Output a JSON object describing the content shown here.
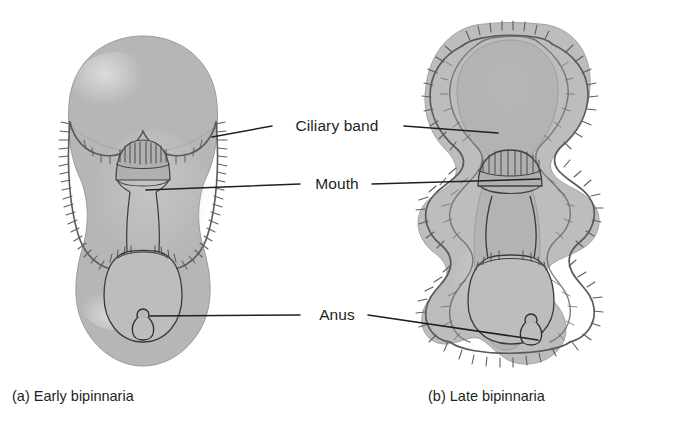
{
  "figure": {
    "type": "biological-diagram",
    "background_color": "#ffffff",
    "ink_color": "#231f20"
  },
  "labels": [
    {
      "id": "ciliary-band",
      "text": "Ciliary band",
      "x": 337,
      "y": 126
    },
    {
      "id": "mouth",
      "text": "Mouth",
      "x": 337,
      "y": 184
    },
    {
      "id": "anus",
      "text": "Anus",
      "x": 337,
      "y": 315
    }
  ],
  "captions": [
    {
      "id": "caption-a",
      "text": "(a) Early bipinnaria",
      "x": 12,
      "y": 388
    },
    {
      "id": "caption-b",
      "text": "(b) Late bipinnaria",
      "x": 428,
      "y": 388
    }
  ],
  "leaders": [
    {
      "id": "ciliary-band-left",
      "from": [
        272,
        126
      ],
      "to": [
        212,
        137
      ]
    },
    {
      "id": "ciliary-band-right",
      "from": [
        404,
        126
      ],
      "to": [
        498,
        133
      ]
    },
    {
      "id": "mouth-left",
      "from": [
        300,
        184
      ],
      "to": [
        146,
        190
      ]
    },
    {
      "id": "mouth-right",
      "from": [
        372,
        184
      ],
      "to": [
        540,
        179
      ]
    },
    {
      "id": "anus-left",
      "from": [
        300,
        315
      ],
      "to": [
        150,
        316
      ]
    },
    {
      "id": "anus-right",
      "from": [
        368,
        315
      ],
      "to": [
        538,
        340
      ]
    }
  ],
  "specimens": [
    {
      "id": "early-bipinnaria",
      "panel": "a",
      "stage": "early",
      "features": [
        "ciliary band",
        "mouth",
        "esophagus",
        "stomach",
        "intestine",
        "anus"
      ]
    },
    {
      "id": "late-bipinnaria",
      "panel": "b",
      "stage": "late",
      "features": [
        "ciliary band",
        "mouth",
        "esophagus",
        "stomach",
        "intestine",
        "anus",
        "lobed arms"
      ]
    }
  ],
  "palette": {
    "body_fill": "#b6b6b6",
    "body_fill_light": "#c9c9c9",
    "highlight": "#d6d6d6",
    "band_fill": "#a8a8a8",
    "band_stroke": "#6f6f6f",
    "outline": "#8c8c8c",
    "gut_stroke": "#3a3a3a",
    "leader_stroke": "#231f20"
  }
}
